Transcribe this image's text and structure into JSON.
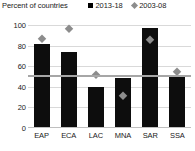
{
  "chart_data": {
    "type": "bar",
    "title": "Percent of countries",
    "xlabel": "",
    "ylabel": "",
    "ylim": [
      0,
      100
    ],
    "yticks": [
      100,
      80,
      60,
      40,
      20,
      0
    ],
    "categories": [
      "EAP",
      "ECA",
      "LAC",
      "MNA",
      "SAR",
      "SSA"
    ],
    "grid": true,
    "legend_position": "top-right",
    "series": [
      {
        "name": "2013-18",
        "marker": "bar",
        "color": "#0d0d0d",
        "values": [
          82,
          74,
          40,
          49,
          97,
          50
        ]
      },
      {
        "name": "2003-08",
        "marker": "diamond",
        "color": "#8c8c8c",
        "values": [
          87,
          97,
          52,
          32,
          86,
          55
        ]
      }
    ],
    "reference_line": {
      "name": "reference",
      "value": 50,
      "color": "#a6a6a6"
    }
  },
  "legend": {
    "items": [
      {
        "label": "2013-18",
        "swatch": "square-marker"
      },
      {
        "label": "2003-08",
        "swatch": "diamond-marker"
      }
    ]
  }
}
